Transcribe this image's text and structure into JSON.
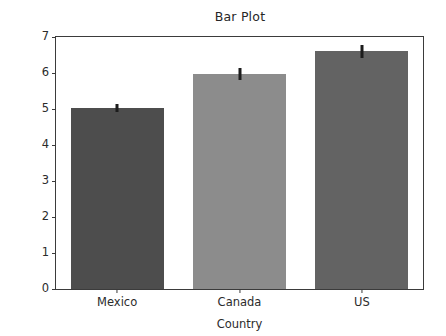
{
  "chart_data": {
    "type": "bar",
    "title": "Bar Plot",
    "xlabel": "Country",
    "ylabel": "CPU Utilization",
    "categories": [
      "Mexico",
      "Canada",
      "US"
    ],
    "values": [
      5.03,
      5.97,
      6.6
    ],
    "errors": [
      0.12,
      0.17,
      0.19
    ],
    "bar_colors": [
      "#4d4d4d",
      "#8c8c8c",
      "#636363"
    ],
    "errorbar_color": "#1c1c1c",
    "ylim": [
      0,
      7
    ],
    "yticks": [
      0,
      1,
      2,
      3,
      4,
      5,
      6,
      7
    ],
    "ytick_labels": [
      "0",
      "1",
      "2",
      "3",
      "4",
      "5",
      "6",
      "7"
    ],
    "grid": false,
    "legend": null
  },
  "figure": {
    "background_color": "#ffffff",
    "axis_color": "#3b3b3b"
  }
}
